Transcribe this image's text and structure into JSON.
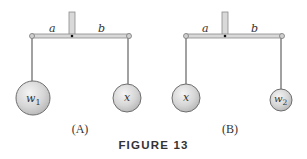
{
  "figure": {
    "caption": "FIGURE 13",
    "colors": {
      "beam_fill": "#d9d9d9",
      "beam_stroke": "#8a8a8a",
      "weight_fill_light": "#f2f2f2",
      "weight_fill_dark": "#bdbdbd",
      "weight_stroke": "#6e6e6e",
      "text": "#333333"
    },
    "panels": [
      {
        "id": "A",
        "label": "(A)",
        "arm_labels": {
          "left": "a",
          "right": "b"
        },
        "left_weight": {
          "label": "w",
          "subscript": "1"
        },
        "right_weight": {
          "label": "x",
          "subscript": ""
        }
      },
      {
        "id": "B",
        "label": "(B)",
        "arm_labels": {
          "left": "a",
          "right": "b"
        },
        "left_weight": {
          "label": "x",
          "subscript": ""
        },
        "right_weight": {
          "label": "w",
          "subscript": "2"
        }
      }
    ]
  }
}
